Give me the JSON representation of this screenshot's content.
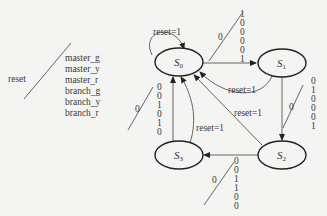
{
  "legend": {
    "input": "reset",
    "outputs": [
      "master_g",
      "master_y",
      "master_r",
      "branch_g",
      "branch_y",
      "branch_r"
    ]
  },
  "states": [
    {
      "id": "S0",
      "base": "S",
      "sub": "0"
    },
    {
      "id": "S1",
      "base": "S",
      "sub": "1"
    },
    {
      "id": "S2",
      "base": "S",
      "sub": "2"
    },
    {
      "id": "S3",
      "base": "S",
      "sub": "3"
    }
  ],
  "transitions": {
    "s0_self": {
      "label": "reset=1"
    },
    "s0_to_s1": {
      "input": "0",
      "outputs": [
        "1",
        "0",
        "0",
        "0",
        "0",
        "1"
      ]
    },
    "s1_to_s0": {
      "label": "reset=1"
    },
    "s1_to_s2": {
      "input": "0",
      "outputs": [
        "0",
        "1",
        "0",
        "0",
        "0",
        "1"
      ]
    },
    "s2_to_s0": {
      "label": "reset=1"
    },
    "s2_to_s3": {
      "input": "0",
      "outputs": [
        "0",
        "0",
        "1",
        "1",
        "0",
        "0"
      ]
    },
    "s3_to_s0_reset": {
      "label": "reset=1"
    },
    "s3_to_s0": {
      "input": "0",
      "outputs": [
        "0",
        "0",
        "1",
        "0",
        "1",
        "0"
      ]
    }
  }
}
